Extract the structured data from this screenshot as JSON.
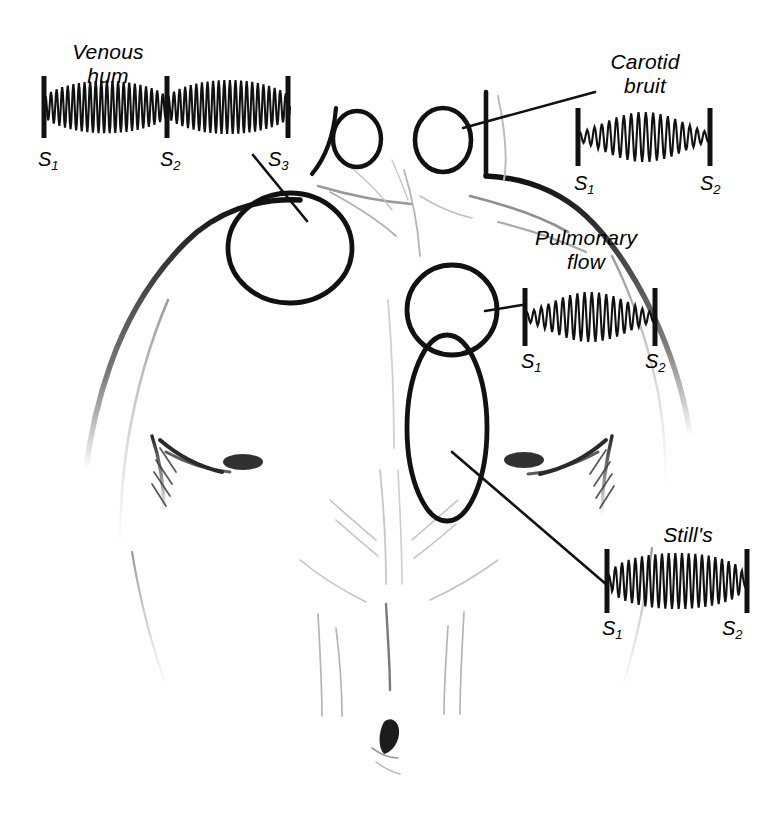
{
  "figure": {
    "background_color": "#ffffff",
    "ink_color": "#111111",
    "shading_color": "#8a8a8a",
    "width": 780,
    "height": 817
  },
  "murmurs": [
    {
      "id": "venous-hum",
      "label": "Venous\nhum",
      "label_x": 108,
      "label_y": 40,
      "type": "continuous",
      "envelope": "continuous-biphasic",
      "heart_sounds": [
        "S1",
        "S2",
        "S3"
      ],
      "trace": {
        "x": 44,
        "y": 80,
        "width": 246,
        "height": 54
      },
      "ticks": [
        {
          "label": "S1",
          "x": 44
        },
        {
          "label": "S2",
          "x": 167
        },
        {
          "label": "S3",
          "x": 288
        }
      ],
      "sound_labels": [
        {
          "text": "S",
          "sub": "1",
          "x": 38,
          "y": 148
        },
        {
          "text": "S",
          "sub": "2",
          "x": 160,
          "y": 148
        },
        {
          "text": "S",
          "sub": "3",
          "x": 268,
          "y": 148
        }
      ],
      "site": {
        "shape": "ellipse",
        "cx": 290,
        "cy": 248,
        "rx": 62,
        "ry": 55
      },
      "leader": {
        "x1": 253,
        "y1": 155,
        "x2": 307,
        "y2": 221
      }
    },
    {
      "id": "carotid-bruit",
      "label": "Carotid\nbruit",
      "label_x": 645,
      "label_y": 50,
      "type": "systolic",
      "envelope": "crescendo-decrescendo",
      "heart_sounds": [
        "S1",
        "S2"
      ],
      "trace": {
        "x": 578,
        "y": 112,
        "width": 132,
        "height": 50
      },
      "ticks": [
        {
          "label": "S1",
          "x": 578
        },
        {
          "label": "S2",
          "x": 710
        }
      ],
      "sound_labels": [
        {
          "text": "S",
          "sub": "1",
          "x": 574,
          "y": 172
        },
        {
          "text": "S",
          "sub": "2",
          "x": 700,
          "y": 172
        }
      ],
      "site": {
        "shape": "ellipse",
        "cx": 443,
        "cy": 140,
        "rx": 28,
        "ry": 32
      },
      "leader": {
        "x1": 463,
        "y1": 128,
        "x2": 595,
        "y2": 92
      }
    },
    {
      "id": "pulmonary-flow",
      "label": "Pulmonary\nflow",
      "label_x": 586,
      "label_y": 226,
      "type": "systolic",
      "envelope": "crescendo-decrescendo",
      "heart_sounds": [
        "S1",
        "S2"
      ],
      "trace": {
        "x": 525,
        "y": 292,
        "width": 130,
        "height": 50
      },
      "ticks": [
        {
          "label": "S1",
          "x": 525
        },
        {
          "label": "S2",
          "x": 655
        }
      ],
      "sound_labels": [
        {
          "text": "S",
          "sub": "1",
          "x": 521,
          "y": 350
        },
        {
          "text": "S",
          "sub": "2",
          "x": 645,
          "y": 350
        }
      ],
      "site": {
        "shape": "ellipse",
        "cx": 452,
        "cy": 310,
        "rx": 45,
        "ry": 45
      },
      "leader": {
        "x1": 485,
        "y1": 311,
        "x2": 522,
        "y2": 305
      }
    },
    {
      "id": "stills",
      "label": "Still's",
      "label_x": 688,
      "label_y": 523,
      "type": "systolic",
      "envelope": "plateau-vibratory",
      "heart_sounds": [
        "S1",
        "S2"
      ],
      "trace": {
        "x": 607,
        "y": 553,
        "width": 140,
        "height": 56
      },
      "ticks": [
        {
          "label": "S1",
          "x": 607
        },
        {
          "label": "S2",
          "x": 747
        }
      ],
      "sound_labels": [
        {
          "text": "S",
          "sub": "1",
          "x": 602,
          "y": 617
        },
        {
          "text": "S",
          "sub": "2",
          "x": 722,
          "y": 617
        }
      ],
      "site": {
        "shape": "ellipse",
        "cx": 447,
        "cy": 428,
        "rx": 40,
        "ry": 93
      },
      "leader": {
        "x1": 452,
        "y1": 452,
        "x2": 607,
        "y2": 585
      }
    }
  ],
  "anatomy": {
    "subject": "anterior chest and neck of a torso",
    "neck_circles": [
      {
        "cx": 357,
        "cy": 139,
        "rx": 24,
        "ry": 28
      },
      {
        "cx": 443,
        "cy": 140,
        "rx": 28,
        "ry": 32
      }
    ]
  }
}
